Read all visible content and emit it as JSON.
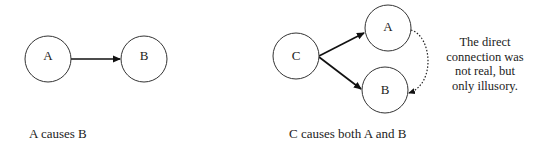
{
  "diagram_left": {
    "nodes": [
      {
        "id": "A",
        "label": "A",
        "cx": 48,
        "cy": 59,
        "r": 23
      },
      {
        "id": "B",
        "label": "B",
        "cx": 144,
        "cy": 59,
        "r": 23
      }
    ],
    "edges": [
      {
        "from": "A",
        "to": "B",
        "style": "solid",
        "arrow": true
      }
    ],
    "caption": "A causes B"
  },
  "diagram_right": {
    "nodes": [
      {
        "id": "C",
        "label": "C",
        "cx": 296,
        "cy": 56,
        "r": 23
      },
      {
        "id": "A",
        "label": "A",
        "cx": 388,
        "cy": 28,
        "r": 23
      },
      {
        "id": "B",
        "label": "B",
        "cx": 385,
        "cy": 90,
        "r": 23
      }
    ],
    "edges": [
      {
        "from": "C",
        "to": "A",
        "style": "solid",
        "arrow": true
      },
      {
        "from": "C",
        "to": "B",
        "style": "solid",
        "arrow": true
      },
      {
        "from": "A",
        "to": "B",
        "style": "dotted",
        "arrow": true
      }
    ],
    "caption": "C causes both A and B"
  },
  "note": {
    "lines": [
      "The direct",
      "connection was",
      "not real, but",
      "only illusory."
    ]
  },
  "colors": {
    "stroke": "#222222",
    "background": "#ffffff"
  }
}
